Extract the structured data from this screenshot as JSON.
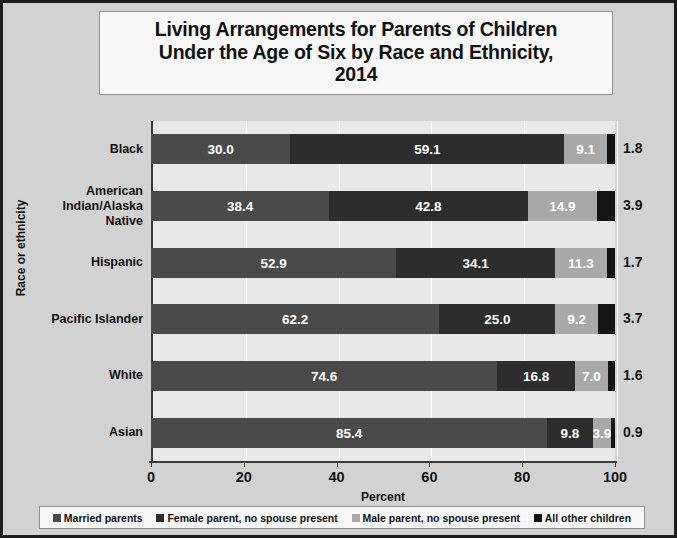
{
  "chart_data": {
    "type": "bar",
    "orientation": "horizontal",
    "stacked": true,
    "title": "Living Arrangements for Parents of Children Under the Age of Six by Race and Ethnicity, 2014",
    "title_lines": [
      "Living Arrangements for Parents of Children",
      "Under the Age of Six by Race and Ethnicity,",
      "2014"
    ],
    "xlabel": "Percent",
    "ylabel": "Race or ethnicity",
    "xlim": [
      0,
      100
    ],
    "xticks": [
      0,
      20,
      40,
      60,
      80,
      100
    ],
    "grid": true,
    "legend_position": "bottom",
    "categories": [
      "Black",
      "American Indian/Alaska Native",
      "Hispanic",
      "Pacific Islander",
      "White",
      "Asian"
    ],
    "series": [
      {
        "name": "Married parents",
        "color": "#4a4a4a",
        "values": [
          30.0,
          38.4,
          52.9,
          62.2,
          74.6,
          85.4
        ]
      },
      {
        "name": "Female parent, no spouse present",
        "color": "#2d2d2d",
        "values": [
          59.1,
          42.8,
          34.1,
          25.0,
          16.8,
          9.8
        ]
      },
      {
        "name": "Male parent, no spouse present",
        "color": "#a9a9a9",
        "values": [
          9.1,
          14.9,
          11.3,
          9.2,
          7.0,
          3.9
        ]
      },
      {
        "name": "All other children",
        "color": "#141414",
        "values": [
          1.8,
          3.9,
          1.7,
          3.7,
          1.6,
          0.9
        ]
      }
    ],
    "value_labels": {
      "Black": [
        "30.0",
        "59.1",
        "9.1",
        "1.8"
      ],
      "American Indian/Alaska Native": [
        "38.4",
        "42.8",
        "14.9",
        "3.9"
      ],
      "Hispanic": [
        "52.9",
        "34.1",
        "11.3",
        "1.7"
      ],
      "Pacific Islander": [
        "62.2",
        "25.0",
        "9.2",
        "3.7"
      ],
      "White": [
        "74.6",
        "16.8",
        "7.0",
        "1.6"
      ],
      "Asian": [
        "85.4",
        "9.8",
        "3.9",
        "0.9"
      ]
    },
    "outside_labels": [
      "1.8",
      "3.9",
      "1.7",
      "3.7",
      "1.6",
      "0.9"
    ]
  },
  "legend": {
    "items": [
      {
        "label": "Married parents"
      },
      {
        "label": "Female parent, no spouse present"
      },
      {
        "label": "Male parent, no spouse present"
      },
      {
        "label": "All other children"
      }
    ]
  },
  "axis": {
    "x_title": "Percent",
    "y_title": "Race or ethnicity",
    "x_tick_labels": [
      "0",
      "20",
      "40",
      "60",
      "80",
      "100"
    ]
  },
  "rows": [
    {
      "category": "Black",
      "category_lines": [
        "Black"
      ],
      "segments": [
        {
          "label": "30.0",
          "value": 30.0,
          "style": "s0",
          "show": true
        },
        {
          "label": "59.1",
          "value": 59.1,
          "style": "s1",
          "show": true
        },
        {
          "label": "9.1",
          "value": 9.1,
          "style": "s2",
          "show": true
        },
        {
          "label": "1.8",
          "value": 1.8,
          "style": "s3",
          "show": false
        }
      ],
      "outside": "1.8"
    },
    {
      "category": "American Indian/Alaska Native",
      "category_lines": [
        "American",
        "Indian/Alaska",
        "Native"
      ],
      "segments": [
        {
          "label": "38.4",
          "value": 38.4,
          "style": "s0",
          "show": true
        },
        {
          "label": "42.8",
          "value": 42.8,
          "style": "s1",
          "show": true
        },
        {
          "label": "14.9",
          "value": 14.9,
          "style": "s2",
          "show": true
        },
        {
          "label": "3.9",
          "value": 3.9,
          "style": "s3",
          "show": false
        }
      ],
      "outside": "3.9"
    },
    {
      "category": "Hispanic",
      "category_lines": [
        "Hispanic"
      ],
      "segments": [
        {
          "label": "52.9",
          "value": 52.9,
          "style": "s0",
          "show": true
        },
        {
          "label": "34.1",
          "value": 34.1,
          "style": "s1",
          "show": true
        },
        {
          "label": "11.3",
          "value": 11.3,
          "style": "s2",
          "show": true
        },
        {
          "label": "1.7",
          "value": 1.7,
          "style": "s3",
          "show": false
        }
      ],
      "outside": "1.7"
    },
    {
      "category": "Pacific Islander",
      "category_lines": [
        "Pacific Islander"
      ],
      "segments": [
        {
          "label": "62.2",
          "value": 62.2,
          "style": "s0",
          "show": true
        },
        {
          "label": "25.0",
          "value": 25.0,
          "style": "s1",
          "show": true
        },
        {
          "label": "9.2",
          "value": 9.2,
          "style": "s2",
          "show": true
        },
        {
          "label": "3.7",
          "value": 3.7,
          "style": "s3",
          "show": false
        }
      ],
      "outside": "3.7"
    },
    {
      "category": "White",
      "category_lines": [
        "White"
      ],
      "segments": [
        {
          "label": "74.6",
          "value": 74.6,
          "style": "s0",
          "show": true
        },
        {
          "label": "16.8",
          "value": 16.8,
          "style": "s1",
          "show": true
        },
        {
          "label": "7.0",
          "value": 7.0,
          "style": "s2",
          "show": true
        },
        {
          "label": "1.6",
          "value": 1.6,
          "style": "s3",
          "show": false
        }
      ],
      "outside": "1.6"
    },
    {
      "category": "Asian",
      "category_lines": [
        "Asian"
      ],
      "segments": [
        {
          "label": "85.4",
          "value": 85.4,
          "style": "s0",
          "show": true
        },
        {
          "label": "9.8",
          "value": 9.8,
          "style": "s1",
          "show": true
        },
        {
          "label": "3.9",
          "value": 3.9,
          "style": "s2",
          "show": true
        },
        {
          "label": "0.9",
          "value": 0.9,
          "style": "s3",
          "show": false
        }
      ],
      "outside": "0.9"
    }
  ],
  "title": {
    "line1": "Living Arrangements for Parents of Children",
    "line2": "Under the Age of Six by Race and Ethnicity,",
    "line3": "2014"
  }
}
